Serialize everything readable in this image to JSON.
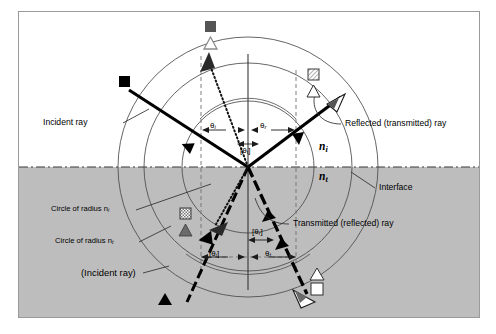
{
  "figure": {
    "background_color": "#ffffff",
    "frame_border_color": "#9a9a9a",
    "medium_upper_color": "#ffffff",
    "medium_lower_color": "#bdbdbd",
    "ray_color": "#000000",
    "construction_line_color": "#555555",
    "dashed_guide_color": "#6f6f6f"
  },
  "labels": {
    "incident_ray": "Incident ray",
    "reflected_transmitted_ray": "Reflected (transmitted) ray",
    "transmitted_reflected_ray": "Transmitted (reflected) ray",
    "incident_ray_parenthetical": "(Incident ray)",
    "interface": "Interface",
    "circle_radius_ni": "Circle of radius n",
    "circle_radius_ni_sub": "i",
    "circle_radius_nt": "Circle of radius n",
    "circle_radius_nt_sub": "t",
    "n_upper": "n",
    "n_upper_sub": "i",
    "n_lower": "n",
    "n_lower_sub": "t"
  },
  "angles": {
    "theta_i_upper": "θ",
    "theta_i_upper_sub": "i",
    "theta_r_upper": "θ",
    "theta_r_upper_sub": "r",
    "theta_t_upper_bracketed": "[θ",
    "theta_t_upper_sub": "t",
    "theta_t_upper_close": "]",
    "theta_r_lower_bracketed": "[θ",
    "theta_r_lower_sub": "r",
    "theta_r_lower_close": "]",
    "theta_i_lower_bracketed": "[θ",
    "theta_i_lower_sub": "i",
    "theta_i_lower_close": "]",
    "theta_t_lower": "θ",
    "theta_t_lower_sub": "t"
  },
  "markers": {
    "top_square": "filled-dark-gray-square",
    "top_triangle": "white-triangle-gray-outline",
    "upper_left_square": "black-filled-square",
    "upper_right_square": "hatched-square",
    "upper_right_triangle": "white-outline-triangle",
    "lower_left_square": "checkered-square",
    "lower_left_triangle": "dark-gray-filled-triangle",
    "bottom_left_triangle": "black-filled-triangle",
    "bottom_right_triangle": "white-outline-triangle",
    "bottom_right_square": "white-filled-square"
  },
  "geometry": {
    "origin_x": 229,
    "origin_y": 155,
    "interface_y": 155,
    "radius_ni": 66,
    "radius_nt": 104,
    "radius_outer": 130,
    "theta_i_degrees": 28,
    "theta_t_degrees": 17
  }
}
